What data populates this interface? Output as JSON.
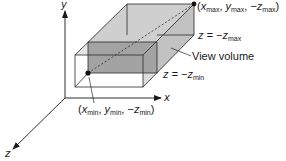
{
  "diagram": {
    "title": "View volume",
    "axes": {
      "x_label": "x",
      "y_label": "y",
      "z_label": "z"
    },
    "labels": {
      "max_corner": {
        "open": "(",
        "x": "x",
        "x_sub": "max",
        "sep1": ", ",
        "y": "y",
        "y_sub": "max",
        "sep2": ", ",
        "neg": "−",
        "z": "z",
        "z_sub": "max",
        "close": ")"
      },
      "far_plane": {
        "lhs": "z = −",
        "var": "z",
        "sub": "max"
      },
      "view_volume": "View volume",
      "near_plane": {
        "lhs": "z = −",
        "var": "z",
        "sub": "min"
      },
      "min_corner": {
        "open": "(",
        "x": "x",
        "x_sub": "min",
        "sep1": ", ",
        "y": "y",
        "y_sub": "min",
        "sep2": ", ",
        "neg": "−",
        "z": "z",
        "z_sub": "min",
        "close": ")"
      }
    },
    "colors": {
      "line": "#2a2a2a",
      "back_face": "#8f8f8f",
      "front_face": "#a6a6a6",
      "side_face": "#c4c4c4",
      "top_face": "#cfcfcf",
      "outer_fill": "#ececec"
    }
  }
}
